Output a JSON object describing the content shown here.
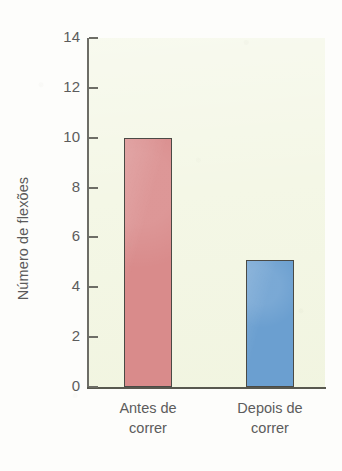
{
  "chart_data": {
    "type": "bar",
    "title": "",
    "subtitle": "",
    "xlabel": "",
    "ylabel": "Número de flexões",
    "categories": [
      "Antes de correr",
      "Depois de correr"
    ],
    "category_lines": [
      [
        "Antes de",
        "correr"
      ],
      [
        "Depois de",
        "correr"
      ]
    ],
    "values": [
      10.0,
      5.1
    ],
    "series": [
      {
        "name": "Número de flexões",
        "values": [
          10.0,
          5.1
        ],
        "colors": [
          "#d98b8b",
          "#6b9fd0"
        ]
      }
    ],
    "ylim": [
      0,
      14
    ],
    "ytick_step": 2,
    "yticks": [
      0,
      2,
      4,
      6,
      8,
      10,
      12,
      14
    ],
    "ytick_labels": [
      "0",
      "2",
      "4",
      "6",
      "8",
      "10",
      "12",
      "14"
    ],
    "xlim_categories": 2,
    "grid": false,
    "legend": false,
    "legend_position": "none",
    "bar_colors": {
      "antes": "#d98b8b",
      "depois": "#6b9fd0"
    },
    "bar_edge_color": "#4a4a45",
    "plot_background": "#f4f7e6",
    "figure_background": "#fdfdfb",
    "axis_color": "#6d6d66",
    "text_color": "#5c5c5c",
    "annotations": []
  }
}
